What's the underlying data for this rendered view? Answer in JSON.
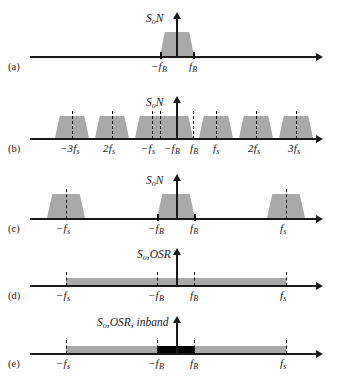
{
  "figure": {
    "type": "spectrum-diagram",
    "background": "#ffffff",
    "fill_gray": "#a9a9a9",
    "fill_black": "#000000",
    "axis_color": "#1a1a1a"
  },
  "panels": [
    {
      "letter": "(a)",
      "ylabel_main": "S",
      "ylabel_sub": "o",
      "ylabel_tail": "N",
      "ticks": [
        {
          "label_main": "−f",
          "label_sub": "B"
        },
        {
          "label_main": "f",
          "label_sub": "B"
        }
      ]
    },
    {
      "letter": "(b)",
      "ylabel_main": "S",
      "ylabel_sub": "o",
      "ylabel_tail": "N",
      "ticks": [
        {
          "label_main": "−3f",
          "label_sub": "s"
        },
        {
          "label_main": "2f",
          "label_sub": "s"
        },
        {
          "label_main": "−f",
          "label_sub": "s"
        },
        {
          "label_main": "−f",
          "label_sub": "B"
        },
        {
          "label_main": "f",
          "label_sub": "B"
        },
        {
          "label_main": "f",
          "label_sub": "s"
        },
        {
          "label_main": "2f",
          "label_sub": "s"
        },
        {
          "label_main": "3f",
          "label_sub": "s"
        }
      ]
    },
    {
      "letter": "(c)",
      "ylabel_main": "S",
      "ylabel_sub": "o",
      "ylabel_tail": "N",
      "ticks": [
        {
          "label_main": "−f",
          "label_sub": "s"
        },
        {
          "label_main": "−f",
          "label_sub": "B"
        },
        {
          "label_main": "f",
          "label_sub": "B"
        },
        {
          "label_main": "f",
          "label_sub": "s"
        }
      ]
    },
    {
      "letter": "(d)",
      "ylabel_main": "S",
      "ylabel_sub": "o",
      "ylabel_tail": ",OSR",
      "ticks": [
        {
          "label_main": "−f",
          "label_sub": "s"
        },
        {
          "label_main": "−f",
          "label_sub": "B"
        },
        {
          "label_main": "f",
          "label_sub": "B"
        },
        {
          "label_main": "f",
          "label_sub": "s"
        }
      ]
    },
    {
      "letter": "(e)",
      "ylabel_main": "S",
      "ylabel_sub": "o",
      "ylabel_tail": ",OSR, inband",
      "ticks": [
        {
          "label_main": "−f",
          "label_sub": "s"
        },
        {
          "label_main": "−f",
          "label_sub": "B"
        },
        {
          "label_main": "f",
          "label_sub": "B"
        },
        {
          "label_main": "f",
          "label_sub": "s"
        }
      ]
    }
  ]
}
